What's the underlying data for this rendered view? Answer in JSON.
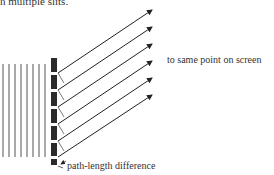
{
  "figure": {
    "caption_fragment": "h multiple slits.",
    "label_screen": "to same point on screen",
    "label_path": "path-length difference",
    "wavefront_count": 8,
    "slit_count": 6,
    "ray_count": 6,
    "colors": {
      "ink": "#333333",
      "barrier": "#2b2b2b",
      "wave": "#555555"
    }
  }
}
